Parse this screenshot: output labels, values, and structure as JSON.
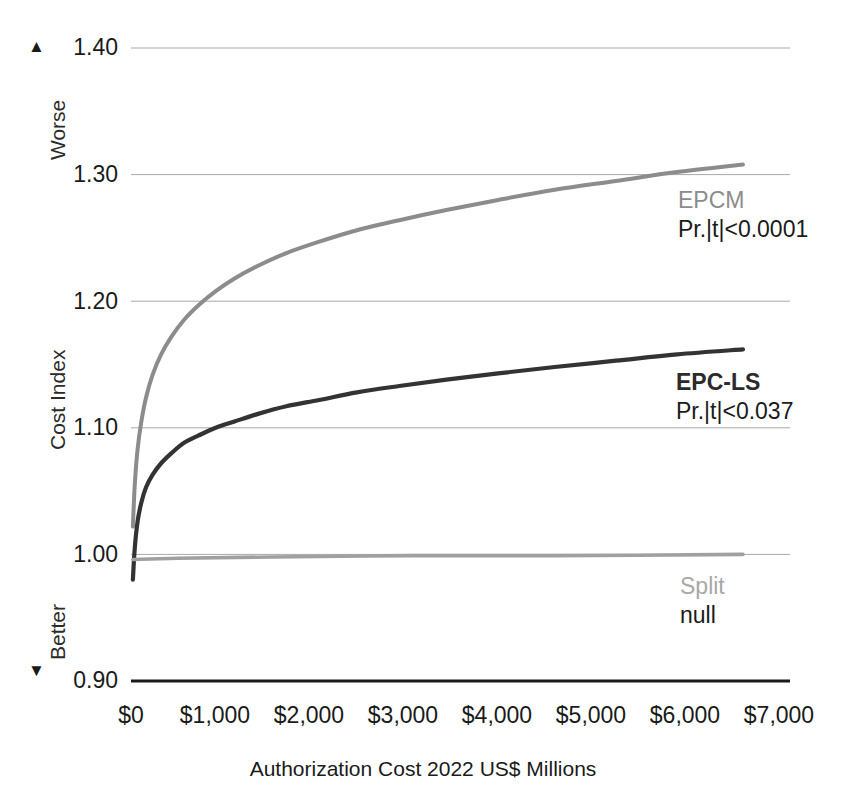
{
  "chart_data": {
    "type": "line",
    "title": "",
    "xlabel": "Authorization Cost 2022 US$ Millions",
    "ylabel": "Cost Index",
    "xlim": [
      0,
      7000
    ],
    "ylim": [
      0.9,
      1.4
    ],
    "grid": true,
    "legend_position": "inline-right",
    "x_tick_labels": [
      "$0",
      "$1,000",
      "$2,000",
      "$3,000",
      "$4,000",
      "$5,000",
      "$6,000",
      "$7,000"
    ],
    "x_tick_values": [
      0,
      1000,
      2000,
      3000,
      4000,
      5000,
      6000,
      7000
    ],
    "y_tick_labels": [
      "1.40",
      "1.30",
      "1.20",
      "1.10",
      "1.00",
      "0.90"
    ],
    "y_tick_values": [
      1.4,
      1.3,
      1.2,
      1.1,
      1.0,
      0.9
    ],
    "axis_direction_labels": {
      "top": "Worse",
      "top_arrow": "▲",
      "bottom": "Better",
      "bottom_arrow": "▼"
    },
    "series": [
      {
        "name": "EPCM",
        "annotation": "Pr.|t|<0.0001",
        "color": "#8c8c8c",
        "x": [
          20,
          40,
          70,
          110,
          160,
          230,
          320,
          430,
          560,
          720,
          900,
          1100,
          1350,
          1650,
          2000,
          2400,
          2850,
          3350,
          3900,
          4500,
          5150,
          5800,
          6500
        ],
        "values": [
          1.022,
          1.055,
          1.083,
          1.105,
          1.124,
          1.142,
          1.158,
          1.172,
          1.185,
          1.197,
          1.208,
          1.218,
          1.228,
          1.238,
          1.247,
          1.256,
          1.264,
          1.272,
          1.28,
          1.288,
          1.295,
          1.302,
          1.308
        ]
      },
      {
        "name": "EPC-LS",
        "annotation": "Pr.|t|<0.037",
        "color": "#333333",
        "x": [
          20,
          40,
          70,
          110,
          160,
          230,
          320,
          430,
          560,
          720,
          900,
          1100,
          1350,
          1650,
          2000,
          2400,
          2850,
          3350,
          3900,
          4500,
          5150,
          5800,
          6500
        ],
        "values": [
          0.98,
          1.005,
          1.026,
          1.041,
          1.053,
          1.063,
          1.072,
          1.08,
          1.088,
          1.094,
          1.1,
          1.105,
          1.111,
          1.117,
          1.122,
          1.128,
          1.133,
          1.138,
          1.143,
          1.148,
          1.153,
          1.158,
          1.162
        ]
      },
      {
        "name": "Split",
        "annotation": "null",
        "color": "#a0a0a0",
        "x": [
          20,
          500,
          1500,
          3000,
          4500,
          6500
        ],
        "values": [
          0.996,
          0.997,
          0.998,
          0.999,
          0.999,
          1.0
        ]
      }
    ]
  },
  "annotations": {
    "epcm": {
      "label": "EPCM",
      "stat": "Pr.|t|<0.0001"
    },
    "epcls": {
      "label": "EPC-LS",
      "stat": "Pr.|t|<0.037"
    },
    "split": {
      "label": "Split",
      "stat": "null"
    }
  },
  "colors": {
    "epcm": "#8c8c8c",
    "epcls": "#333333",
    "split": "#a0a0a0",
    "gridline": "#a9a9a9",
    "baseline": "#1a1a1a",
    "text": "#1a1a1a"
  }
}
